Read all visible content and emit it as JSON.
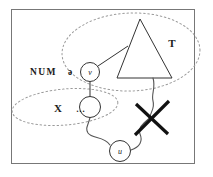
{
  "figure": {
    "kind": "syntactic-tree-diagram",
    "background_color": "#ffffff",
    "frame": {
      "name": "figure-frame",
      "stroke_color": "#777777",
      "x": 11,
      "y": 9,
      "width": 184,
      "height": 155
    },
    "labels": {
      "feature_label": "NUM",
      "schwa_label": "ə",
      "set_label_t": "T",
      "set_label_x": "X",
      "ellipsis": "…",
      "node_v": "v",
      "node_u": "u",
      "node_empty": ""
    },
    "nodes": [
      {
        "id": "v",
        "label": "v",
        "cx": 90,
        "cy": 72,
        "r": 9.5,
        "stroke": "#333333"
      },
      {
        "id": "mid",
        "label": "",
        "cx": 90,
        "cy": 107,
        "r": 10.5,
        "stroke": "#333333"
      },
      {
        "id": "u",
        "label": "u",
        "cx": 120,
        "cy": 151,
        "r": 10.5,
        "stroke": "#333333"
      }
    ],
    "triangle": {
      "name": "phrase-triangle",
      "apex": [
        140,
        19
      ],
      "base_left": [
        117,
        78
      ],
      "base_right": [
        172,
        78
      ],
      "stroke": "#333333"
    },
    "ellipses": [
      {
        "name": "dotted-ellipse-t",
        "cx": 131,
        "cy": 52,
        "rx": 69,
        "ry": 39,
        "rotate": -2,
        "stroke": "#999999",
        "dash": "1.6 2.6"
      },
      {
        "name": "dotted-ellipse-x",
        "cx": 65,
        "cy": 107,
        "rx": 53,
        "ry": 18,
        "rotate": -5,
        "stroke": "#999999",
        "dash": "1.6 2.6"
      }
    ],
    "label_positions": {
      "feature": {
        "x": 30,
        "y": 72
      },
      "schwa": {
        "x": 70,
        "y": 72
      },
      "set_t": {
        "x": 172,
        "y": 43
      },
      "set_x": {
        "x": 58,
        "y": 108
      },
      "ellipsis": {
        "x": 82,
        "y": 109
      }
    },
    "edges": [
      {
        "name": "edge-v-to-triangle",
        "type": "straight",
        "path": "M 98 66 L 128 46",
        "stroke": "#333333"
      },
      {
        "name": "edge-v-to-mid",
        "type": "straight",
        "path": "M 90 81.5 L 90 96.5",
        "stroke": "#333333"
      },
      {
        "name": "edge-mid-to-u",
        "type": "wavy",
        "path": "M 90 117.5 C 88 126, 85 128, 88 133 C 92 139, 104 136, 110 145",
        "stroke": "#555555"
      },
      {
        "name": "edge-u-to-crossed",
        "type": "wavy",
        "path": "M 131 150 C 140 147, 143 141, 140 134 C 137 127, 145 123, 150 117",
        "stroke": "#555555"
      },
      {
        "name": "edge-triangle-to-crossed",
        "type": "wavy",
        "path": "M 153 78 C 156 88, 151 94, 153 101 C 155 108, 151 111, 150 117",
        "stroke": "#555555"
      }
    ],
    "cross_mark": {
      "name": "deletion-cross",
      "stroke": "#111111",
      "stroke_width": 3.2,
      "line_a": {
        "x1": 136,
        "y1": 104,
        "x2": 168,
        "y2": 134
      },
      "line_b": {
        "x1": 169,
        "y1": 101,
        "x2": 135,
        "y2": 135
      }
    }
  }
}
